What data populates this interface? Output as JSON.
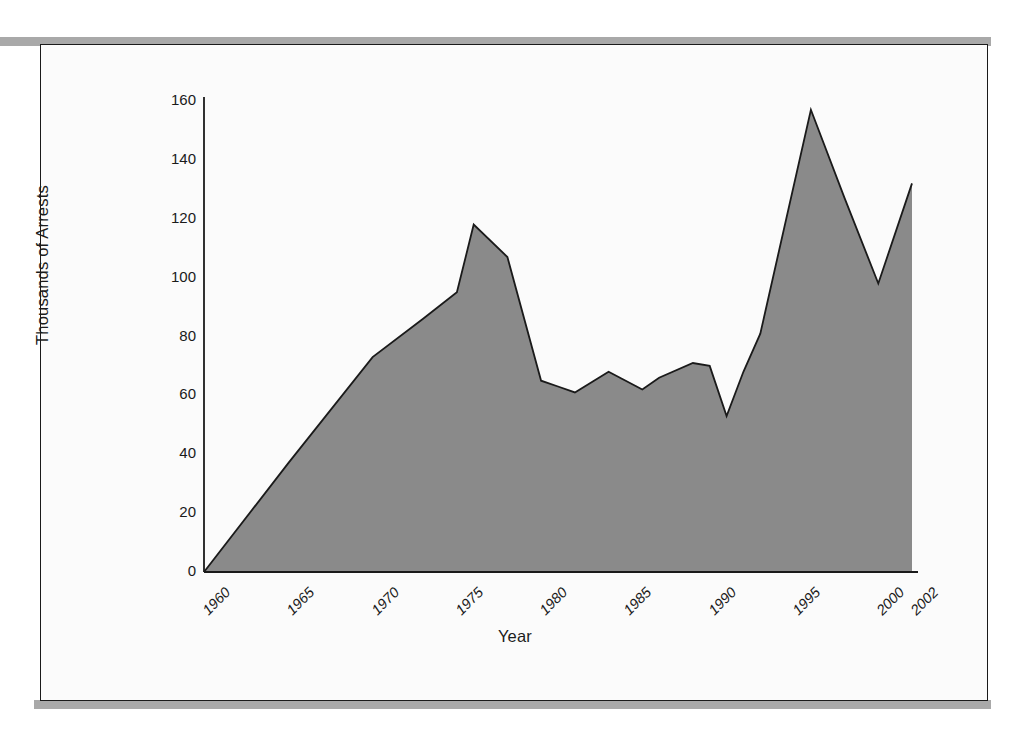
{
  "figure": {
    "frame_border_color": "#1a1a1a",
    "page_rule_color": "#a9a9a9",
    "plot_background": "#fbfbfb"
  },
  "chart_data": {
    "type": "area",
    "title": "",
    "xlabel": "Year",
    "ylabel": "Thousands of Arrests",
    "xlim": [
      1960,
      2002
    ],
    "ylim": [
      0,
      160
    ],
    "grid": false,
    "legend": null,
    "area_fill_color": "#8a8a8a",
    "line_color": "#1a1a1a",
    "y_ticks": [
      0,
      20,
      40,
      60,
      80,
      100,
      120,
      140,
      160
    ],
    "y_tick_labels": [
      "0",
      "20",
      "40",
      "60",
      "80",
      "100",
      "120",
      "140",
      "160"
    ],
    "x_ticks": [
      1960,
      1965,
      1970,
      1975,
      1980,
      1985,
      1990,
      1995,
      2000,
      2002
    ],
    "x_tick_labels": [
      "1960",
      "1965",
      "1970",
      "1975",
      "1980",
      "1985",
      "1990",
      "1995",
      "2000",
      "2002"
    ],
    "x": [
      1960,
      1965,
      1970,
      1973,
      1975,
      1976,
      1978,
      1980,
      1981,
      1982,
      1984,
      1986,
      1987,
      1989,
      1990,
      1991,
      1992,
      1993,
      1996,
      1998,
      2000,
      2002
    ],
    "values": [
      0,
      37,
      73,
      86,
      95,
      118,
      107,
      65,
      63,
      61,
      68,
      62,
      66,
      71,
      70,
      53,
      68,
      81,
      157,
      127,
      98,
      132
    ],
    "series": [
      {
        "name": "Arrests",
        "values": [
          0,
          37,
          73,
          86,
          95,
          118,
          107,
          65,
          63,
          61,
          68,
          62,
          66,
          71,
          70,
          53,
          68,
          81,
          157,
          127,
          98,
          132
        ]
      }
    ]
  }
}
